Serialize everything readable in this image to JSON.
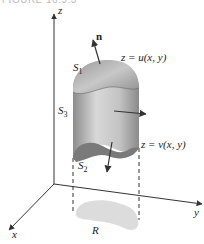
{
  "caption": "FIGURE 16.9.3",
  "axes": {
    "x": "x",
    "y": "y",
    "z": "z"
  },
  "labels": {
    "normal": "n",
    "S1": "S",
    "S1_sub": "1",
    "S2": "S",
    "S2_sub": "2",
    "S3": "S",
    "S3_sub": "3",
    "upper_surface_eq": "z = u(x, y)",
    "lower_surface_eq": "z = v(x, y)",
    "region": "R"
  },
  "colors": {
    "solid_light": "#d4d4d4",
    "solid_dark": "#8a8a8a",
    "region": "#dcdcdc",
    "line": "#333333"
  }
}
